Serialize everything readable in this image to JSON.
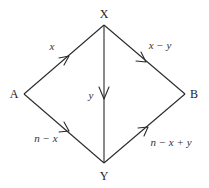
{
  "diagram": {
    "type": "directed-graph",
    "colors": {
      "line": "#2a2a2a",
      "text": "#222222",
      "background": "#ffffff"
    },
    "nodes": [
      {
        "id": "X",
        "label": "X",
        "x": 104,
        "y": 25
      },
      {
        "id": "Y",
        "label": "Y",
        "x": 104,
        "y": 163
      },
      {
        "id": "A",
        "label": "A",
        "x": 24,
        "y": 94
      },
      {
        "id": "B",
        "label": "B",
        "x": 185,
        "y": 94
      }
    ],
    "edges": [
      {
        "from": "A",
        "to": "X",
        "label": "x"
      },
      {
        "from": "X",
        "to": "B",
        "label": "x − y"
      },
      {
        "from": "X",
        "to": "Y",
        "label": "y"
      },
      {
        "from": "A",
        "to": "Y",
        "label": "n − x"
      },
      {
        "from": "Y",
        "to": "B",
        "label": "n − x + y"
      }
    ]
  }
}
